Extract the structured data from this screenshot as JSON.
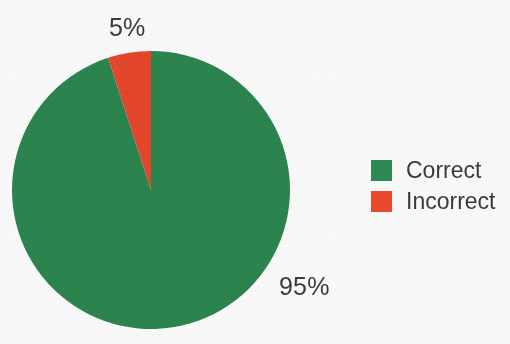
{
  "chart_data": {
    "type": "pie",
    "title": "",
    "categories": [
      "Correct",
      "Incorrect"
    ],
    "values": [
      95,
      5
    ],
    "value_labels": [
      "95%",
      "5%"
    ],
    "unit": "percent",
    "total": 100,
    "start_angle_deg": 0,
    "direction": "counterclockwise",
    "legend_position": "right",
    "grid": false,
    "slices": [
      {
        "name": "Correct",
        "value": 95,
        "label": "95%",
        "color": "#2E8B52",
        "label_position": "outside-bottom-right"
      },
      {
        "name": "Incorrect",
        "value": 5,
        "label": "5%",
        "color": "#EF4A2E",
        "label_position": "outside-top"
      }
    ]
  },
  "labels": {
    "incorrect_pct": "5%",
    "correct_pct": "95%"
  },
  "legend": {
    "items": [
      {
        "label": "Correct",
        "color": "#2E8B52",
        "swatch_name": "legend-swatch-correct"
      },
      {
        "label": "Incorrect",
        "color": "#EF4A2E",
        "swatch_name": "legend-swatch-incorrect"
      }
    ]
  },
  "colors": {
    "background": "#fdfdfd",
    "text": "#3c3c3c",
    "correct": "#2E8B52",
    "incorrect": "#EF4A2E"
  }
}
